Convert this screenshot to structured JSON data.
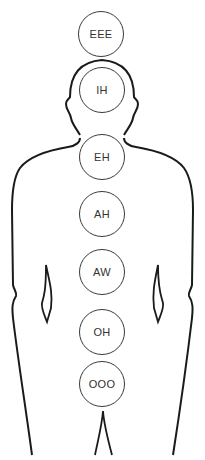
{
  "diagram": {
    "type": "body-resonance-map",
    "outline_color": "#1a1a1a",
    "circle_color": "#3a3a3a",
    "text_color": "#333333",
    "nodes": [
      {
        "label": "EEE",
        "cx": 101,
        "cy": 34
      },
      {
        "label": "IH",
        "cx": 102,
        "cy": 90
      },
      {
        "label": "EH",
        "cx": 102,
        "cy": 157
      },
      {
        "label": "AH",
        "cx": 102,
        "cy": 214
      },
      {
        "label": "AW",
        "cx": 102,
        "cy": 272
      },
      {
        "label": "OH",
        "cx": 102,
        "cy": 332
      },
      {
        "label": "OOO",
        "cx": 102,
        "cy": 384
      }
    ]
  }
}
